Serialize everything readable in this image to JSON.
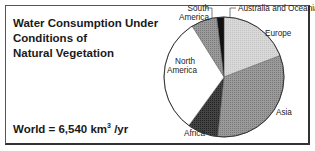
{
  "chart_data": {
    "type": "pie",
    "title": "Water Consumption Under Conditions of Natural Vegetation",
    "title_lines": [
      "Water Consumption Under",
      "Conditions of",
      "Natural Vegetation"
    ],
    "total": {
      "label": "World = 6,540 km",
      "superscript": "3",
      "suffix": " /yr",
      "value": 6540,
      "unit": "km3/yr"
    },
    "start_angle_deg": 0,
    "direction": "clockwise",
    "slices": [
      {
        "name": "Europe",
        "percent": 19.2,
        "color": "#d4d4d4",
        "pattern": "light-stipple"
      },
      {
        "name": "Asia",
        "percent": 32.5,
        "color": "#8e8e8e",
        "pattern": "medium-stipple"
      },
      {
        "name": "Africa",
        "percent": 8.3,
        "color": "#3a3a3a",
        "pattern": "dark-stipple"
      },
      {
        "name": "North America",
        "percent": 31.1,
        "color": "#ffffff",
        "pattern": "none"
      },
      {
        "name": "South America",
        "percent": 7.0,
        "color": "#9a9a9a",
        "pattern": "medium-stipple"
      },
      {
        "name": "Australia and Oceania",
        "percent": 1.9,
        "color": "#111111",
        "pattern": "solid"
      }
    ],
    "labels": {
      "europe": "Europe",
      "asia": "Asia",
      "africa": "Africa",
      "north_america": [
        "North",
        "America"
      ],
      "south_america": [
        "South",
        "America"
      ],
      "australia": "Australia and Oceania"
    },
    "legend": "none (direct labels)"
  }
}
